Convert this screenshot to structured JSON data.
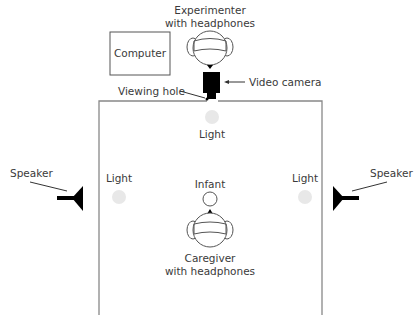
{
  "diagram": {
    "type": "experimental-setup-floor-plan",
    "labels": {
      "experimenter_line1": "Experimenter",
      "experimenter_line2": "with headphones",
      "computer": "Computer",
      "video_camera": "Video camera",
      "viewing_hole": "Viewing hole",
      "light_top": "Light",
      "light_left": "Light",
      "light_right": "Light",
      "speaker_left": "Speaker",
      "speaker_right": "Speaker",
      "infant": "Infant",
      "caregiver_line1": "Caregiver",
      "caregiver_line2": "with headphones"
    },
    "colors": {
      "line": "#555555",
      "wall": "#888888",
      "fill_dark": "#000000",
      "light": "#e8e8e8",
      "text": "#3a3a3a"
    }
  }
}
